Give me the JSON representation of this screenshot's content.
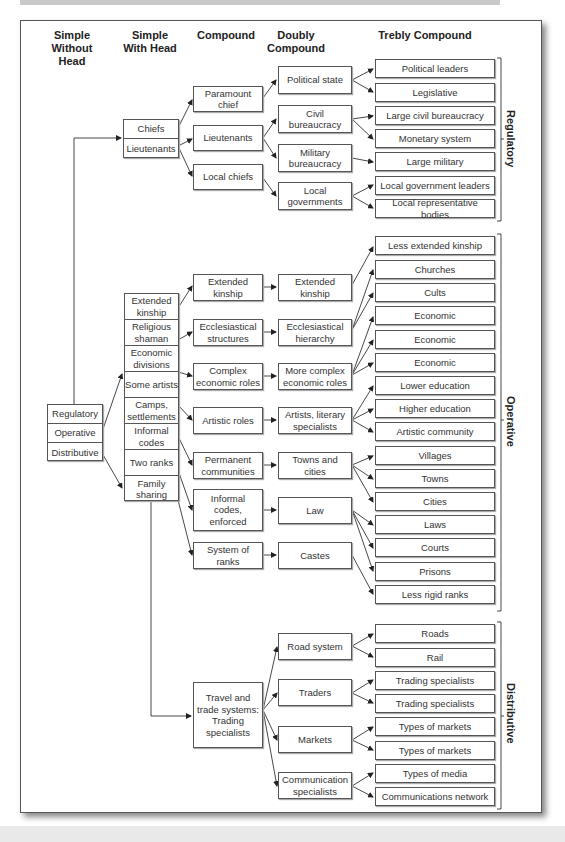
{
  "headers": {
    "simple_without_head": "Simple Without Head",
    "simple_with_head": "Simple With Head",
    "compound": "Compound",
    "doubly_compound": "Doubly Compound",
    "trebly_compound": "Trebly Compound"
  },
  "simple_without_head": [
    "Regulatory",
    "Operative",
    "Distributive"
  ],
  "regulatory": {
    "simple_with_head": [
      "Chiefs",
      "Lieutenants"
    ],
    "compound": [
      "Paramount chief",
      "Lieutenants",
      "Local chiefs"
    ],
    "doubly": [
      "Political state",
      "Civil bureaucracy",
      "Military bureaucracy",
      "Local governments"
    ],
    "trebly": [
      "Political leaders",
      "Legislative",
      "Large civil bureaucracy",
      "Monetary system",
      "Large military",
      "Local government leaders",
      "Local representative bodies"
    ],
    "label": "Regulatory"
  },
  "operative": {
    "simple_with_head": [
      "Extended kinship",
      "Religious shaman",
      "Economic divisions",
      "Some artists",
      "Camps, settlements",
      "Informal codes",
      "Two ranks",
      "Family sharing"
    ],
    "compound": [
      "Extended kinship",
      "Ecclesiastical structures",
      "Complex economic roles",
      "Artistic roles",
      "Permanent communities",
      "Informal codes, enforced",
      "System of ranks"
    ],
    "doubly": [
      "Extended kinship",
      "Ecclesiastical hierarchy",
      "More complex economic roles",
      "Artists, literary specialists",
      "Towns and cities",
      "Law",
      "Castes"
    ],
    "trebly": [
      "Less extended kinship",
      "Churches",
      "Cults",
      "Economic",
      "Economic",
      "Economic",
      "Lower education",
      "Higher education",
      "Artistic community",
      "Villages",
      "Towns",
      "Cities",
      "Laws",
      "Courts",
      "Prisons",
      "Less rigid ranks"
    ],
    "label": "Operative"
  },
  "distributive": {
    "compound": [
      "Travel and trade systems: Trading specialists"
    ],
    "doubly": [
      "Road system",
      "Traders",
      "Markets",
      "Communication specialists"
    ],
    "trebly": [
      "Roads",
      "Rail",
      "Trading specialists",
      "Trading specialists",
      "Types of markets",
      "Types of markets",
      "Types of media",
      "Communications network"
    ],
    "label": "Distributive"
  }
}
